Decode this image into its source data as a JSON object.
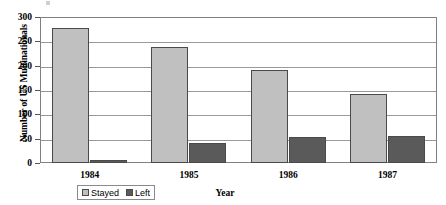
{
  "chart_data": {
    "type": "bar",
    "title": "",
    "xlabel": "Year",
    "ylabel": "Number of US Multinationals",
    "categories": [
      "1984",
      "1985",
      "1986",
      "1987"
    ],
    "series": [
      {
        "name": "Stayed",
        "color": "#c0c0c0",
        "values": [
          277,
          239,
          191,
          141
        ]
      },
      {
        "name": "Left",
        "color": "#5a5a5a",
        "values": [
          7,
          41,
          53,
          55
        ]
      }
    ],
    "ylim": [
      0,
      300
    ],
    "ytick_labels": [
      "300",
      "250",
      "200",
      "150",
      "100",
      "50",
      "0"
    ],
    "ytick_values": [
      300,
      250,
      200,
      150,
      100,
      50,
      0
    ],
    "grid": true,
    "legend_position": "bottom-left"
  },
  "axes": {
    "y_title": "Number of US Multinationals",
    "x_title": "Year"
  },
  "legend": {
    "items": [
      {
        "label": "Stayed",
        "swatch": "stayed"
      },
      {
        "label": "Left",
        "swatch": "left"
      }
    ]
  }
}
